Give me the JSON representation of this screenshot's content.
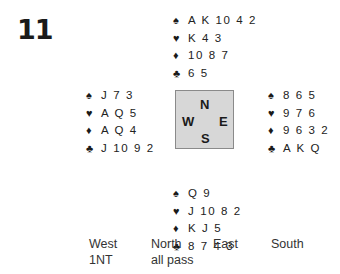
{
  "deal_number": "11",
  "compass": {
    "north": "N",
    "south": "S",
    "west": "W",
    "east": "E"
  },
  "suit_symbols": {
    "spades": "♠",
    "hearts": "♥",
    "diamonds": "♦",
    "clubs": "♣"
  },
  "hands": {
    "north": {
      "spades": "A K 10 4 2",
      "hearts": "K 4 3",
      "diamonds": "10 8 7",
      "clubs": "6 5"
    },
    "west": {
      "spades": "J 7 3",
      "hearts": "A Q 5",
      "diamonds": "A Q 4",
      "clubs": "J 10 9 2"
    },
    "east": {
      "spades": "8 6 5",
      "hearts": "9 7 6",
      "diamonds": "9 6 3 2",
      "clubs": "A K Q"
    },
    "south": {
      "spades": "Q 9",
      "hearts": "J 10 8 2",
      "diamonds": "K J 5",
      "clubs": "8 7 4 3"
    }
  },
  "auction": {
    "headers": [
      "West",
      "North",
      "East",
      "South"
    ],
    "rows": [
      [
        "1NT",
        "all pass",
        "",
        ""
      ]
    ]
  }
}
